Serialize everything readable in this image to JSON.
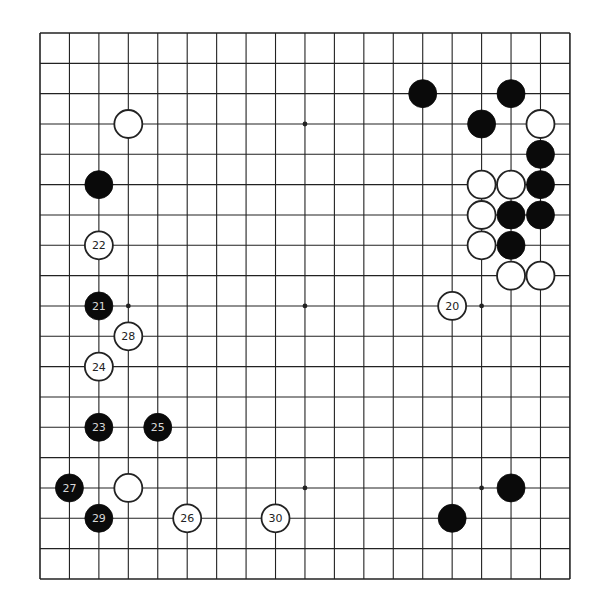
{
  "board": {
    "size": 19,
    "origin_x": 40,
    "origin_y": 33,
    "spacing_x": 29.44,
    "spacing_y": 30.33,
    "line_color": "#222222",
    "background": "#ffffff",
    "stone_radius": 14,
    "star_points": [
      [
        3,
        3
      ],
      [
        9,
        3
      ],
      [
        15,
        3
      ],
      [
        3,
        9
      ],
      [
        9,
        9
      ],
      [
        15,
        9
      ],
      [
        3,
        15
      ],
      [
        9,
        15
      ],
      [
        15,
        15
      ]
    ]
  },
  "colors": {
    "black_stone": "#0a0a0a",
    "white_stone": "#ffffff",
    "white_stroke": "#222222",
    "black_label": "#d8d8d8",
    "white_label": "#222222"
  },
  "stones": [
    {
      "color": "white",
      "col": 3,
      "row": 3,
      "label": ""
    },
    {
      "color": "black",
      "col": 2,
      "row": 5,
      "label": ""
    },
    {
      "color": "black",
      "col": 13,
      "row": 2,
      "label": ""
    },
    {
      "color": "black",
      "col": 16,
      "row": 2,
      "label": ""
    },
    {
      "color": "black",
      "col": 15,
      "row": 3,
      "label": ""
    },
    {
      "color": "white",
      "col": 17,
      "row": 3,
      "label": ""
    },
    {
      "color": "black",
      "col": 17,
      "row": 4,
      "label": ""
    },
    {
      "color": "white",
      "col": 15,
      "row": 5,
      "label": ""
    },
    {
      "color": "white",
      "col": 16,
      "row": 5,
      "label": ""
    },
    {
      "color": "black",
      "col": 17,
      "row": 5,
      "label": ""
    },
    {
      "color": "white",
      "col": 15,
      "row": 6,
      "label": ""
    },
    {
      "color": "black",
      "col": 16,
      "row": 6,
      "label": ""
    },
    {
      "color": "black",
      "col": 17,
      "row": 6,
      "label": ""
    },
    {
      "color": "white",
      "col": 15,
      "row": 7,
      "label": ""
    },
    {
      "color": "black",
      "col": 16,
      "row": 7,
      "label": ""
    },
    {
      "color": "white",
      "col": 16,
      "row": 8,
      "label": ""
    },
    {
      "color": "white",
      "col": 17,
      "row": 8,
      "label": ""
    },
    {
      "color": "white",
      "col": 14,
      "row": 9,
      "label": "20"
    },
    {
      "color": "black",
      "col": 2,
      "row": 9,
      "label": "21"
    },
    {
      "color": "white",
      "col": 2,
      "row": 7,
      "label": "22"
    },
    {
      "color": "black",
      "col": 2,
      "row": 13,
      "label": "23"
    },
    {
      "color": "white",
      "col": 2,
      "row": 11,
      "label": "24"
    },
    {
      "color": "black",
      "col": 4,
      "row": 13,
      "label": "25"
    },
    {
      "color": "white",
      "col": 5,
      "row": 16,
      "label": "26"
    },
    {
      "color": "black",
      "col": 1,
      "row": 15,
      "label": "27"
    },
    {
      "color": "white",
      "col": 3,
      "row": 10,
      "label": "28"
    },
    {
      "color": "black",
      "col": 2,
      "row": 16,
      "label": "29"
    },
    {
      "color": "white",
      "col": 8,
      "row": 16,
      "label": "30"
    },
    {
      "color": "white",
      "col": 3,
      "row": 15,
      "label": ""
    },
    {
      "color": "black",
      "col": 16,
      "row": 15,
      "label": ""
    },
    {
      "color": "black",
      "col": 14,
      "row": 16,
      "label": ""
    }
  ]
}
